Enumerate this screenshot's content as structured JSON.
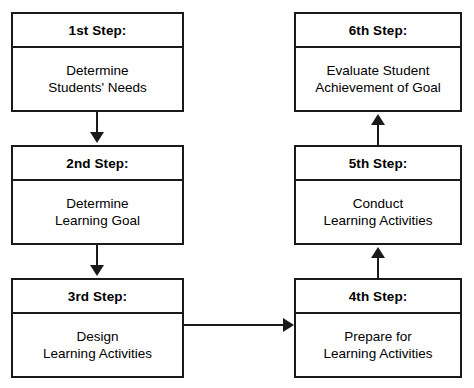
{
  "diagram": {
    "type": "flowchart",
    "orientation": "two-column-serpentine",
    "line_color": "#1a1a1a",
    "background_color": "#ffffff",
    "steps": [
      {
        "id": "step1",
        "header": "1st Step:",
        "body_line1": "Determine",
        "body_line2": "Students' Needs"
      },
      {
        "id": "step2",
        "header": "2nd Step:",
        "body_line1": "Determine",
        "body_line2": "Learning Goal"
      },
      {
        "id": "step3",
        "header": "3rd Step:",
        "body_line1": "Design",
        "body_line2": "Learning Activities"
      },
      {
        "id": "step4",
        "header": "4th Step:",
        "body_line1": "Prepare for",
        "body_line2": "Learning Activities"
      },
      {
        "id": "step5",
        "header": "5th Step:",
        "body_line1": "Conduct",
        "body_line2": "Learning Activities"
      },
      {
        "id": "step6",
        "header": "6th Step:",
        "body_line1": "Evaluate Student",
        "body_line2": "Achievement of Goal"
      }
    ],
    "connectors": [
      {
        "id": "conn-1-2",
        "from": "step1",
        "to": "step2",
        "direction": "down"
      },
      {
        "id": "conn-2-3",
        "from": "step2",
        "to": "step3",
        "direction": "down"
      },
      {
        "id": "conn-3-4",
        "from": "step3",
        "to": "step4",
        "direction": "right"
      },
      {
        "id": "conn-4-5",
        "from": "step4",
        "to": "step5",
        "direction": "up"
      },
      {
        "id": "conn-5-6",
        "from": "step5",
        "to": "step6",
        "direction": "up"
      }
    ]
  }
}
